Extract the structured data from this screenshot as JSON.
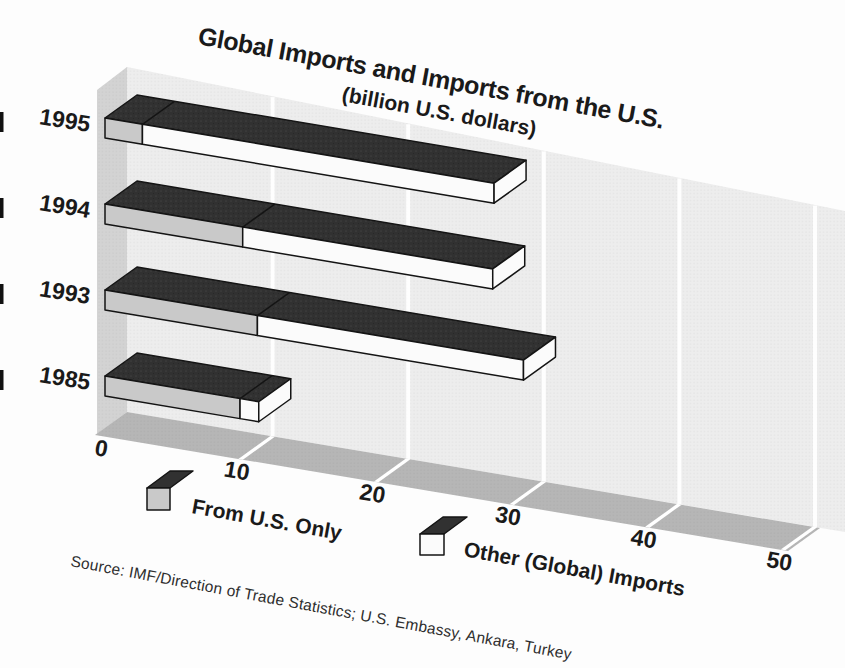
{
  "page": {
    "title": "Global Imports and Imports from the U.S.",
    "subtitle": "(billion U.S. dollars)",
    "source": "Source: IMF/Direction of Trade Statistics; U.S. Embassy, Ankara, Turkey"
  },
  "legend": {
    "items": [
      {
        "label": "From U.S. Only",
        "swatch": "cube-gray-front"
      },
      {
        "label": "Other (Global) Imports",
        "swatch": "cube-white-front"
      }
    ]
  },
  "axis": {
    "y_categories": [
      "1995",
      "1994",
      "1993",
      "1985"
    ],
    "x_ticks": [
      "0",
      "10",
      "20",
      "30",
      "40",
      "50"
    ]
  },
  "chart_data": {
    "type": "bar",
    "subtype": "horizontal-stacked-3d",
    "stacked": true,
    "title": "Global Imports and Imports from the U.S.",
    "subtitle": "(billion U.S. dollars)",
    "categories": [
      "1995",
      "1994",
      "1993",
      "1985"
    ],
    "series": [
      {
        "name": "From U.S. Only",
        "values": [
          2.8,
          10.3,
          11.4,
          10.1
        ]
      },
      {
        "name": "Other (Global) Imports",
        "values": [
          26.3,
          18.7,
          19.9,
          1.4
        ]
      }
    ],
    "totals": [
      29.1,
      29.0,
      31.3,
      11.5
    ],
    "x_ticks": [
      0,
      10,
      20,
      30,
      40,
      50
    ],
    "xlim": [
      0,
      50
    ],
    "xlabel": "billion U.S. dollars",
    "ylabel": "year",
    "grid": true,
    "legend_position": "bottom",
    "source": "IMF/Direction of Trade Statistics; U.S. Embassy, Ankara, Turkey"
  },
  "colors": {
    "bar_top": "#313131",
    "from_us_front": "#c9c9c9",
    "other_front": "#fbfbfb",
    "bar_outline": "#141414",
    "left_wall": "#d3d3d3",
    "back_wall": "#ededed",
    "floor": "#b6b6b6",
    "gridline": "#ffffff",
    "text": "#1a1a1a",
    "background": "#fdfdfd"
  }
}
